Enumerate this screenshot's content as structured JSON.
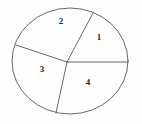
{
  "figure": {
    "background_color": "#fdfdfd",
    "stroke_color": "#575757",
    "label_color": "#2b2b2b",
    "canvas": {
      "width": 142,
      "height": 124
    }
  },
  "chart_data": {
    "type": "pie",
    "xlabel": "",
    "ylabel": "",
    "grid": false,
    "legend": "none",
    "shape": "ellipse",
    "ellipse": {
      "center_x": 70,
      "center_y": 61,
      "radius_x": 58,
      "radius_y": 53
    },
    "vertex": {
      "x": 67,
      "y": 62
    },
    "categories": [
      "1",
      "2",
      "3",
      "4"
    ],
    "values": [
      1,
      1,
      1,
      1
    ],
    "labels": [
      "1",
      "2",
      "3",
      "4"
    ],
    "segments": [
      {
        "name": "1",
        "label": "1",
        "label_x": 99,
        "label_y": 38,
        "position": "upper-right"
      },
      {
        "name": "2",
        "label": "2",
        "label_x": 61,
        "label_y": 22,
        "position": "upper-left"
      },
      {
        "name": "3",
        "label": "3",
        "label_x": 42,
        "label_y": 70,
        "position": "left"
      },
      {
        "name": "4",
        "label": "4",
        "label_x": 88,
        "label_y": 83,
        "position": "lower-right"
      }
    ],
    "dividers": [
      {
        "name": "divider-upper",
        "from_x": 67,
        "from_y": 62,
        "to_x": 93,
        "to_y": 13
      },
      {
        "name": "divider-right",
        "from_x": 67,
        "from_y": 62,
        "to_x": 128,
        "to_y": 62
      },
      {
        "name": "divider-lower",
        "from_x": 67,
        "from_y": 62,
        "to_x": 56,
        "to_y": 113
      },
      {
        "name": "divider-left",
        "from_x": 67,
        "from_y": 62,
        "to_x": 16,
        "to_y": 45
      }
    ]
  }
}
